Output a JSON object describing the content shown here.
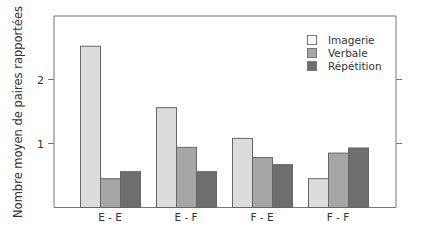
{
  "chart_data": {
    "type": "bar",
    "title": "",
    "xlabel": "",
    "ylabel": "Nombre moyen de paires rapportées",
    "categories": [
      "E - E",
      "E - F",
      "F - E",
      "F - F"
    ],
    "series": [
      {
        "name": "Imagerie",
        "values": [
          2.52,
          1.56,
          1.08,
          0.45
        ],
        "color": "#dcdcdc",
        "legend_color": "#ffffff"
      },
      {
        "name": "Verbale",
        "values": [
          0.45,
          0.94,
          0.78,
          0.85
        ],
        "color": "#a6a6a6",
        "legend_color": "#a6a6a6"
      },
      {
        "name": "Répétition",
        "values": [
          0.56,
          0.56,
          0.67,
          0.93
        ],
        "color": "#6e6e6e",
        "legend_color": "#6e6e6e"
      }
    ],
    "yticks": [
      1,
      2
    ],
    "ylim": [
      0,
      3.0
    ],
    "grid": false,
    "legend_position": "top-right inside"
  },
  "labels": {
    "ylabel": "Nombre moyen de paires rapportées",
    "ytick_1": "1",
    "ytick_2": "2"
  }
}
